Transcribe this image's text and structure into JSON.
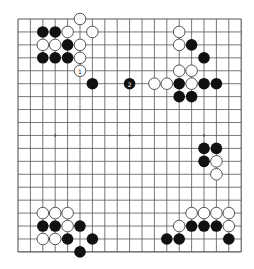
{
  "board": {
    "size": 19,
    "origin_x": 18,
    "origin_y": 19,
    "spacing_x": 12.4,
    "spacing_y": 12.94,
    "stone_radius": 5.8,
    "colors": {
      "background": "#ffffff",
      "grid_line": "#555555",
      "black_stone": "#111111",
      "white_stone_fill": "#ffffff",
      "white_stone_stroke": "#444444"
    },
    "star_points": [
      [
        3,
        9
      ],
      [
        9,
        9
      ],
      [
        15,
        9
      ]
    ]
  },
  "stones": {
    "black": [
      {
        "x": 2,
        "y": 1
      },
      {
        "x": 3,
        "y": 1
      },
      {
        "x": 4,
        "y": 2
      },
      {
        "x": 2,
        "y": 3
      },
      {
        "x": 3,
        "y": 3
      },
      {
        "x": 4,
        "y": 3
      },
      {
        "x": 6,
        "y": 5
      },
      {
        "x": 9,
        "y": 5,
        "label": "2"
      },
      {
        "x": 14,
        "y": 2
      },
      {
        "x": 15,
        "y": 3
      },
      {
        "x": 13,
        "y": 5
      },
      {
        "x": 15,
        "y": 5
      },
      {
        "x": 16,
        "y": 5
      },
      {
        "x": 13,
        "y": 6
      },
      {
        "x": 14,
        "y": 6
      },
      {
        "x": 15,
        "y": 10
      },
      {
        "x": 16,
        "y": 10
      },
      {
        "x": 15,
        "y": 11
      },
      {
        "x": 2,
        "y": 16
      },
      {
        "x": 3,
        "y": 16
      },
      {
        "x": 5,
        "y": 16
      },
      {
        "x": 4,
        "y": 17
      },
      {
        "x": 6,
        "y": 17
      },
      {
        "x": 5,
        "y": 18
      },
      {
        "x": 14,
        "y": 16
      },
      {
        "x": 15,
        "y": 16
      },
      {
        "x": 16,
        "y": 16
      },
      {
        "x": 12,
        "y": 17
      },
      {
        "x": 13,
        "y": 17
      },
      {
        "x": 17,
        "y": 17
      }
    ],
    "white": [
      {
        "x": 5,
        "y": 0
      },
      {
        "x": 4,
        "y": 1
      },
      {
        "x": 6,
        "y": 1
      },
      {
        "x": 2,
        "y": 2
      },
      {
        "x": 3,
        "y": 2
      },
      {
        "x": 5,
        "y": 2
      },
      {
        "x": 5,
        "y": 3
      },
      {
        "x": 5,
        "y": 4,
        "label": "1"
      },
      {
        "x": 13,
        "y": 1
      },
      {
        "x": 13,
        "y": 2
      },
      {
        "x": 13,
        "y": 4
      },
      {
        "x": 14,
        "y": 4
      },
      {
        "x": 11,
        "y": 5
      },
      {
        "x": 12,
        "y": 5
      },
      {
        "x": 14,
        "y": 5
      },
      {
        "x": 16,
        "y": 11
      },
      {
        "x": 16,
        "y": 12
      },
      {
        "x": 2,
        "y": 15
      },
      {
        "x": 3,
        "y": 15
      },
      {
        "x": 4,
        "y": 15
      },
      {
        "x": 4,
        "y": 16
      },
      {
        "x": 2,
        "y": 17
      },
      {
        "x": 3,
        "y": 17
      },
      {
        "x": 14,
        "y": 15
      },
      {
        "x": 15,
        "y": 15
      },
      {
        "x": 16,
        "y": 15
      },
      {
        "x": 17,
        "y": 15
      },
      {
        "x": 13,
        "y": 16
      },
      {
        "x": 17,
        "y": 16
      }
    ]
  }
}
